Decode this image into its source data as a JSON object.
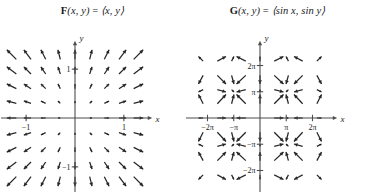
{
  "figure": {
    "background_color": "#ffffff",
    "ink_color": "#262626",
    "axis_color": "#4d4d4d",
    "panels": [
      {
        "id": "panel-F",
        "title": {
          "vector_name": "F",
          "arguments": "(x, y)",
          "equals": "=",
          "components": "⟨x, y⟩",
          "full_text": "F(x, y) = ⟨x, y⟩"
        },
        "axes": {
          "x_label": "x",
          "y_label": "y",
          "x_ticks": [
            {
              "value": -1,
              "label": "−1"
            },
            {
              "value": 1,
              "label": "1"
            }
          ],
          "y_ticks": [
            {
              "value": 1,
              "label": "1"
            },
            {
              "value": -1,
              "label": "−1"
            }
          ],
          "xlim": [
            -1.35,
            1.35
          ],
          "ylim": [
            -1.35,
            1.35
          ],
          "grid": false
        },
        "field": {
          "type": "radial-outward",
          "formula": "F(x, y) = <x, y>",
          "sample_min": -1.2,
          "sample_max": 1.2,
          "sample_count": 9,
          "arrow_scale": 0.45
        }
      },
      {
        "id": "panel-G",
        "title": {
          "vector_name": "G",
          "arguments": "(x, y)",
          "equals": "=",
          "components": "⟨sin x, sin y⟩",
          "full_text": "G(x, y) = ⟨sin x, sin y⟩"
        },
        "axes": {
          "x_label": "x",
          "y_label": "y",
          "x_ticks": [
            {
              "value": -6.283185,
              "label": "−2π"
            },
            {
              "value": -3.141593,
              "label": "−π"
            },
            {
              "value": 3.141593,
              "label": "π"
            },
            {
              "value": 6.283185,
              "label": "2π"
            }
          ],
          "y_ticks": [
            {
              "value": 6.283185,
              "label": "2π"
            },
            {
              "value": 3.141593,
              "label": "π"
            },
            {
              "value": -3.141593,
              "label": "−π"
            },
            {
              "value": -6.283185,
              "label": "−2π"
            }
          ],
          "xlim": [
            -7.9,
            7.9
          ],
          "ylim": [
            -7.9,
            7.9
          ],
          "grid": false
        },
        "field": {
          "type": "sinusoidal",
          "formula": "G(x, y) = <sin x, sin y>",
          "sample_min": -6.8068,
          "sample_max": 6.8068,
          "sample_count": 9,
          "arrow_scale": 1.45
        }
      }
    ]
  },
  "chart_data": {
    "type": "scatter",
    "panels": [
      {
        "name": "F(x, y) = ⟨x, y⟩",
        "xlabel": "x",
        "ylabel": "y",
        "xlim": [
          -1.35,
          1.35
        ],
        "ylim": [
          -1.35,
          1.35
        ],
        "xticks": [
          -1,
          1
        ],
        "xticklabels": [
          "−1",
          "1"
        ],
        "yticks": [
          -1,
          1
        ],
        "yticklabels": [
          "−1",
          "1"
        ],
        "description": "Radial vector field; all arrows point directly away from the origin with magnitude increasing linearly with distance from the origin.",
        "grid_x": [
          -1.2,
          -0.9,
          -0.6,
          -0.3,
          0,
          0.3,
          0.6,
          0.9,
          1.2
        ],
        "grid_y": [
          -1.2,
          -0.9,
          -0.6,
          -0.3,
          0,
          0.3,
          0.6,
          0.9,
          1.2
        ],
        "u_formula": "u = x",
        "v_formula": "v = y"
      },
      {
        "name": "G(x, y) = ⟨sin x, sin y⟩",
        "xlabel": "x",
        "ylabel": "y",
        "xlim": [
          -7.9,
          7.9
        ],
        "ylim": [
          -7.9,
          7.9
        ],
        "xticks": [
          -6.283185,
          -3.141593,
          3.141593,
          6.283185
        ],
        "xticklabels": [
          "−2π",
          "−π",
          "π",
          "2π"
        ],
        "yticks": [
          -6.283185,
          -3.141593,
          3.141593,
          6.283185
        ],
        "yticklabels": [
          "−2π",
          "−π",
          "π",
          "2π"
        ],
        "description": "Periodic vector field; arrow components are sin x horizontally and sin y vertically, producing a repeating cellular pattern of sources and sinks.",
        "grid_x": [
          -6.8068,
          -5.1051,
          -3.4034,
          -1.7017,
          0,
          1.7017,
          3.4034,
          5.1051,
          6.8068
        ],
        "grid_y": [
          -6.8068,
          -5.1051,
          -3.4034,
          -1.7017,
          0,
          1.7017,
          3.4034,
          5.1051,
          6.8068
        ],
        "u_formula": "u = sin x",
        "v_formula": "v = sin y"
      }
    ]
  }
}
